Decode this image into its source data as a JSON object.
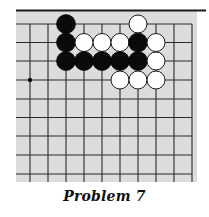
{
  "diagram": {
    "type": "go-problem",
    "caption": "Problem 7",
    "board": {
      "background_color": "#dcdcdc",
      "line_color": "#2a2a2a",
      "edge_color": "#1a1a1a",
      "visible_edges": [
        "top"
      ],
      "area": {
        "x0": 16,
        "y0": 10,
        "x1": 197,
        "y1": 182
      },
      "top_edge_y": 10.5,
      "columns_x": [
        30,
        48,
        66,
        84,
        102,
        120,
        138,
        156,
        174,
        192
      ],
      "rows_y": [
        24,
        42.5,
        61,
        80,
        99,
        117.5,
        136,
        155,
        174
      ],
      "stone_diameter": 19,
      "star_points": [
        {
          "col": 0,
          "row": 3
        }
      ],
      "stones": [
        {
          "color": "black",
          "col": 2,
          "row": 0
        },
        {
          "color": "white",
          "col": 6,
          "row": 0
        },
        {
          "color": "black",
          "col": 2,
          "row": 1
        },
        {
          "color": "white",
          "col": 3,
          "row": 1
        },
        {
          "color": "white",
          "col": 4,
          "row": 1
        },
        {
          "color": "white",
          "col": 5,
          "row": 1
        },
        {
          "color": "black",
          "col": 6,
          "row": 1
        },
        {
          "color": "white",
          "col": 7,
          "row": 1
        },
        {
          "color": "black",
          "col": 2,
          "row": 2
        },
        {
          "color": "black",
          "col": 3,
          "row": 2
        },
        {
          "color": "black",
          "col": 4,
          "row": 2
        },
        {
          "color": "black",
          "col": 5,
          "row": 2
        },
        {
          "color": "black",
          "col": 6,
          "row": 2
        },
        {
          "color": "white",
          "col": 7,
          "row": 2
        },
        {
          "color": "white",
          "col": 5,
          "row": 3
        },
        {
          "color": "white",
          "col": 6,
          "row": 3
        },
        {
          "color": "white",
          "col": 7,
          "row": 3
        }
      ]
    }
  }
}
